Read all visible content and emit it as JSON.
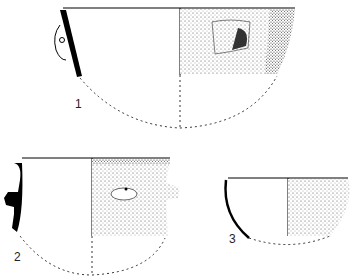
{
  "figure": {
    "type": "pottery profile drawings",
    "vessels": [
      {
        "number": "1",
        "description": "Deep bowl with perforated lug handle"
      },
      {
        "number": "2",
        "description": "Carinated bowl with knobbed lugs"
      },
      {
        "number": "3",
        "description": "Small hemispherical bowl"
      }
    ]
  }
}
